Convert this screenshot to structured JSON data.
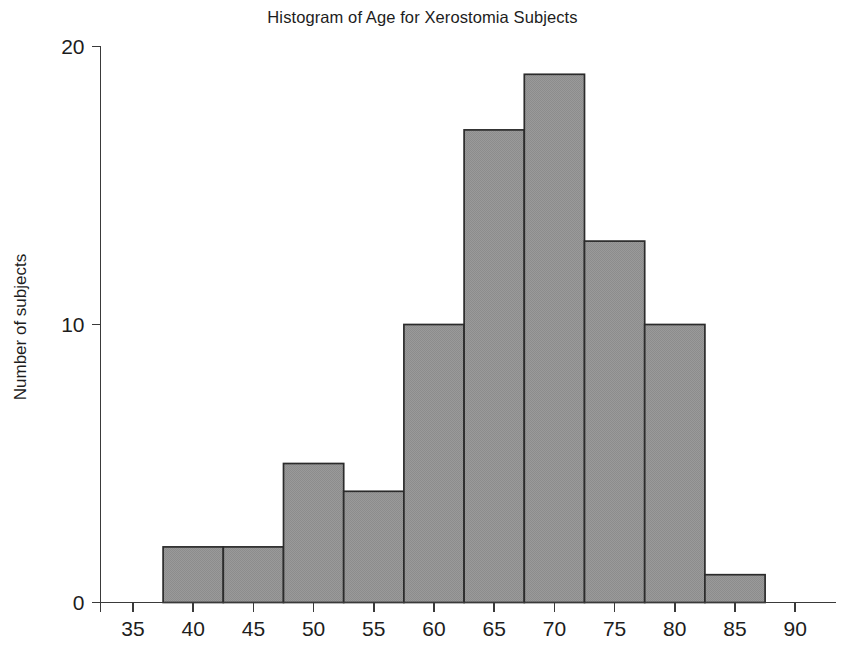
{
  "chart_data": {
    "type": "bar",
    "title": "Histogram of Age for Xerostomia Subjects",
    "xlabel": "",
    "ylabel": "Number of subjects",
    "xlim": [
      33.0,
      91.5
    ],
    "ylim": [
      0,
      20
    ],
    "grid": false,
    "legend": null,
    "bin_width": 5,
    "bin_edges": [
      37.5,
      42.5,
      47.5,
      52.5,
      57.5,
      62.5,
      67.5,
      72.5,
      77.5,
      82.5,
      87.5
    ],
    "bin_centers": [
      40,
      45,
      50,
      55,
      60,
      65,
      70,
      75,
      80,
      85
    ],
    "categories": [
      "37.5-42.5",
      "42.5-47.5",
      "47.5-52.5",
      "52.5-57.5",
      "57.5-62.5",
      "62.5-67.5",
      "67.5-72.5",
      "72.5-77.5",
      "77.5-82.5",
      "82.5-87.5"
    ],
    "values": [
      2,
      2,
      5,
      4,
      10,
      17,
      19,
      13,
      10,
      1
    ],
    "total_subjects": 83,
    "xticks": [
      35,
      40,
      45,
      50,
      55,
      60,
      65,
      70,
      75,
      80,
      85,
      90
    ],
    "xtick_labels": [
      "35",
      "40",
      "45",
      "50",
      "55",
      "60",
      "65",
      "70",
      "75",
      "80",
      "85",
      "90"
    ],
    "yticks": [
      0,
      10,
      20
    ],
    "ytick_labels": [
      "0",
      "10",
      "20"
    ],
    "colors": {
      "bar_fill": "#949494",
      "bar_edge": "#2b2b2b",
      "axis": "#3a3a3a",
      "text": "#1d1d1d",
      "background": "#ffffff"
    }
  }
}
